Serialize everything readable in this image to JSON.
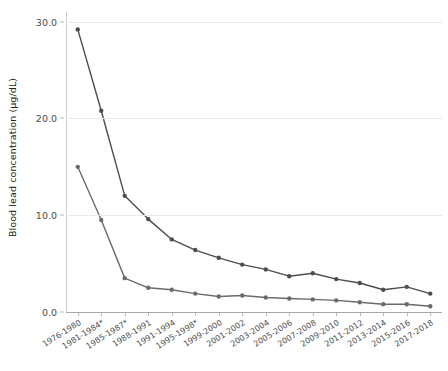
{
  "chart_data": {
    "type": "line",
    "title": "",
    "xlabel": "",
    "ylabel": "Blood lead concentration (µg/dL)",
    "ylim": [
      0.0,
      31.0
    ],
    "yticks": [
      "0.0",
      "10.0",
      "20.0",
      "30.0"
    ],
    "ytick_values": [
      0.0,
      10.0,
      20.0,
      30.0
    ],
    "grid": "horizontal",
    "legend": "none",
    "marker": "circle",
    "categories": [
      "1976-1980",
      "1981-1984*",
      "1985-1987*",
      "1988-1991",
      "1991-1994",
      "1995-1998*",
      "1999-2000",
      "2001-2002",
      "2003-2004",
      "2005-2006",
      "2007-2008",
      "2009-2010",
      "2011-2012",
      "2013-2014",
      "2015-2016",
      "2017-2018"
    ],
    "series": [
      {
        "name": "series-1",
        "color": "#4d4d4d",
        "values": [
          29.2,
          20.8,
          12.0,
          9.6,
          7.5,
          6.4,
          5.6,
          4.9,
          4.4,
          3.7,
          4.0,
          3.4,
          3.0,
          2.3,
          2.6,
          1.9
        ]
      },
      {
        "name": "series-2",
        "color": "#6b6b6b",
        "values": [
          15.0,
          9.5,
          3.5,
          2.5,
          2.3,
          1.9,
          1.6,
          1.7,
          1.5,
          1.4,
          1.3,
          1.2,
          1.0,
          0.8,
          0.8,
          0.6
        ]
      }
    ]
  }
}
